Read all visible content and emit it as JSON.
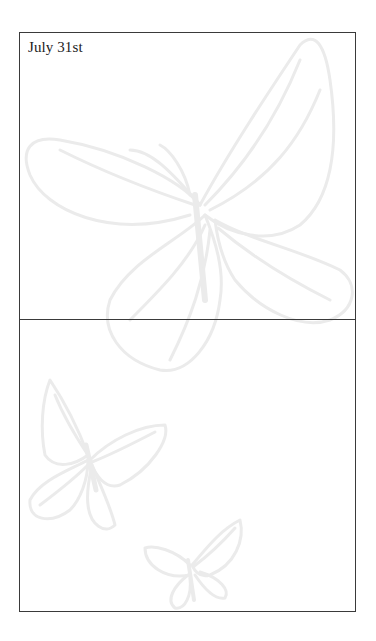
{
  "page": {
    "date_label": "July 31st",
    "sections": [
      {
        "id": "top",
        "content": ""
      },
      {
        "id": "bottom",
        "content": ""
      }
    ],
    "decorations": [
      {
        "icon": "butterfly-icon",
        "size": "large",
        "position": "top-right"
      },
      {
        "icon": "butterfly-icon",
        "size": "medium",
        "position": "bottom-left"
      },
      {
        "icon": "butterfly-icon",
        "size": "small",
        "position": "bottom-center"
      }
    ],
    "colors": {
      "border": "#3a3a3a",
      "text": "#222222",
      "watermark": "#ececec",
      "background": "#ffffff"
    }
  }
}
